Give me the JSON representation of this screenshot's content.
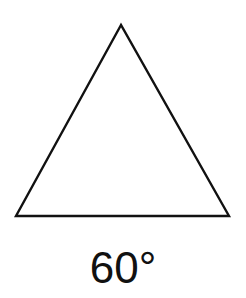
{
  "diagram": {
    "shape": "equilateral-triangle",
    "vertices": {
      "apex": [
        121,
        25
      ],
      "bottom_left": [
        16,
        216
      ],
      "bottom_right": [
        229,
        216
      ]
    },
    "stroke_color": "#111111",
    "fill_color": "#ffffff",
    "label": "60°"
  }
}
